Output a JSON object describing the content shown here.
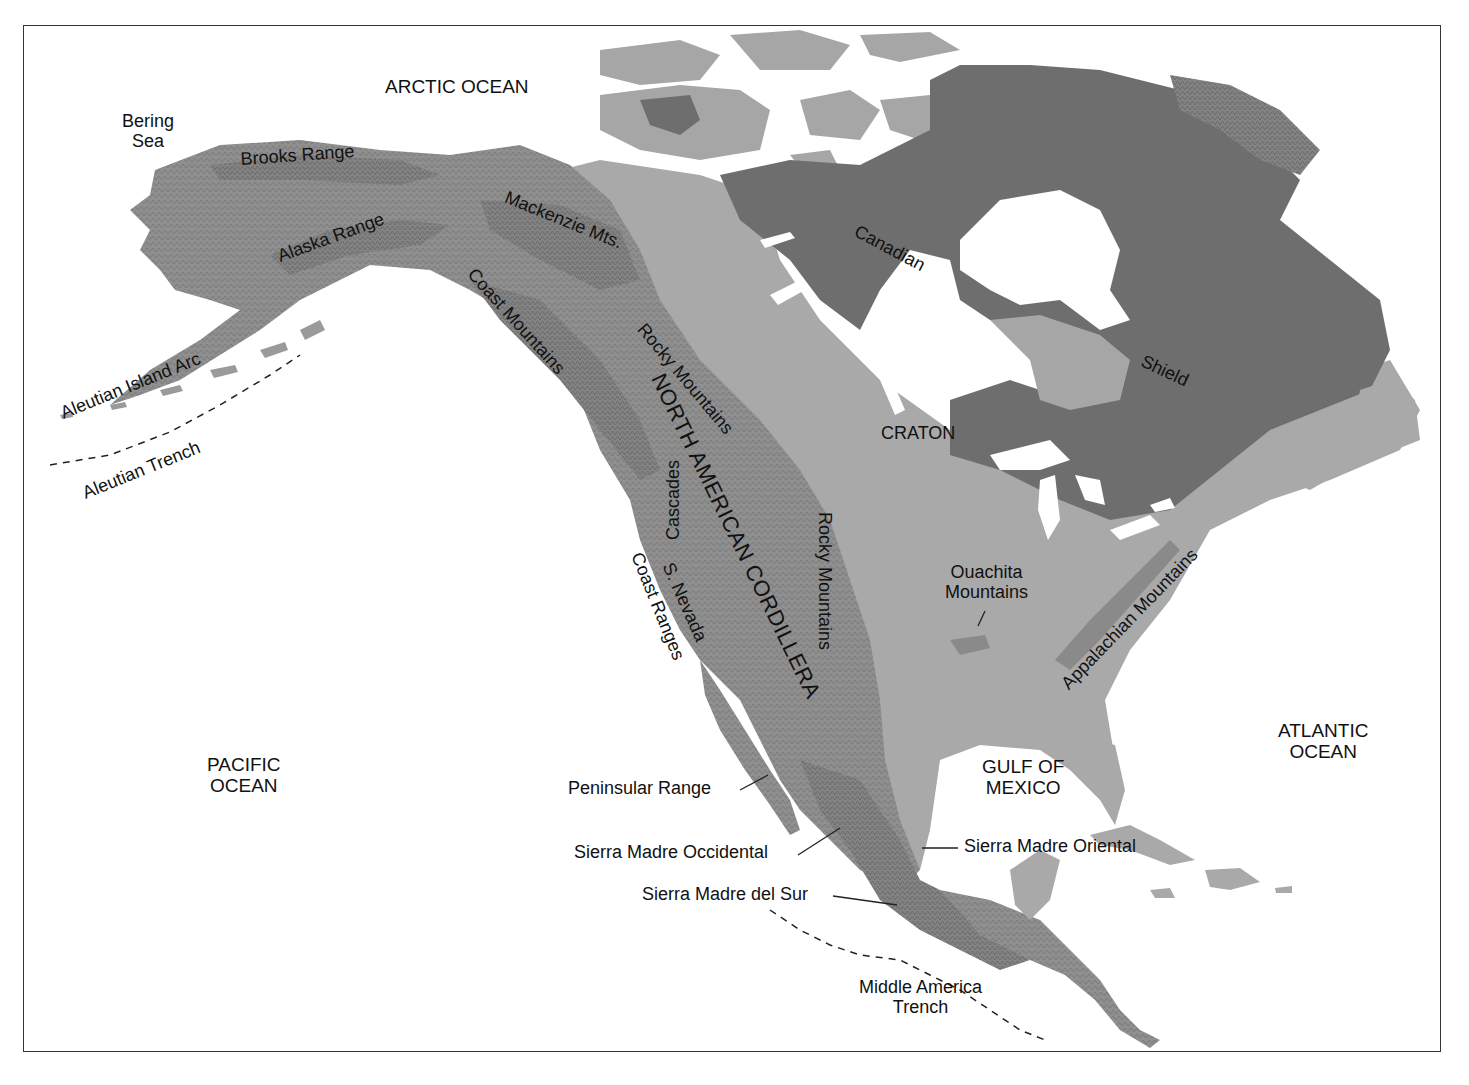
{
  "map": {
    "colors": {
      "background": "#ffffff",
      "ocean": "#ffffff",
      "lowland": "#a9a9a9",
      "cordillera": "#8f8f8f",
      "cordillera_dark": "#7a7a7a",
      "craton_shield": "#6e6e6e",
      "arctic_platform": "#a6a6a6",
      "text": "#111111",
      "border": "#333333"
    },
    "oceans": {
      "arctic": "ARCTIC OCEAN",
      "bering": [
        "Bering",
        "Sea"
      ],
      "pacific": [
        "PACIFIC",
        "OCEAN"
      ],
      "atlantic": [
        "ATLANTIC",
        "OCEAN"
      ],
      "gulf": [
        "GULF OF",
        "MEXICO"
      ]
    },
    "regions": {
      "cordillera": "NORTH AMERICAN CORDILLERA",
      "shield_1": "Canadian",
      "shield_2": "Shield",
      "craton": "CRATON"
    },
    "mountains": {
      "brooks": "Brooks Range",
      "alaska": "Alaska Range",
      "mackenzie": "Mackenzie Mts.",
      "coast_mtns": "Coast Mountains",
      "rocky_north": "Rocky Mountains",
      "rocky_south": "Rocky Mountains",
      "cascades": "Cascades",
      "sierra_nevada": "S. Nevada",
      "coast_ranges": "Coast Ranges",
      "ouachita": [
        "Ouachita",
        "Mountains"
      ],
      "appalachian": "Appalachian Mountains",
      "peninsular": "Peninsular Range",
      "sm_occidental": "Sierra Madre Occidental",
      "sm_oriental": "Sierra Madre Oriental",
      "sm_del_sur": "Sierra Madre del Sur"
    },
    "tectonic": {
      "aleutian_arc": "Aleutian Island Arc",
      "aleutian_trench": "Aleutian Trench",
      "middle_america_trench": [
        "Middle America",
        "Trench"
      ]
    }
  }
}
